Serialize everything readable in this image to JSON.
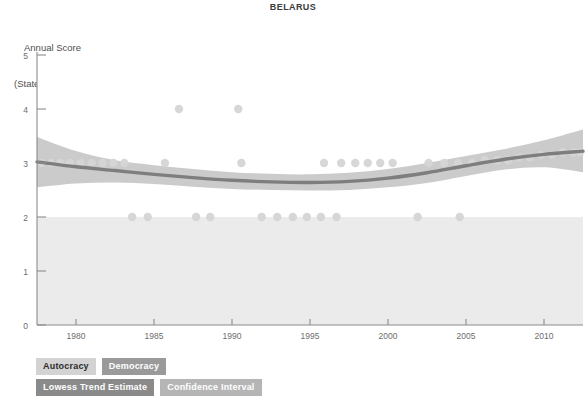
{
  "chart_data": {
    "type": "scatter",
    "title": "BELARUS",
    "ylabel_line1": "Annual Score",
    "ylabel_line2": "(State Department)",
    "xlabel": "",
    "xlim": [
      1977.5,
      2012.5
    ],
    "ylim": [
      0,
      5
    ],
    "yticks": [
      0,
      1,
      2,
      3,
      4,
      5
    ],
    "xticks": [
      1980,
      1985,
      1990,
      1995,
      2000,
      2005,
      2010
    ],
    "grid": false,
    "legend_position": "bottom-left",
    "series": [
      {
        "name": "Annual Score points",
        "points": [
          {
            "x": 1977.8,
            "y": 3.0
          },
          {
            "x": 1978.4,
            "y": 3.0
          },
          {
            "x": 1979.0,
            "y": 3.0
          },
          {
            "x": 1979.6,
            "y": 3.0
          },
          {
            "x": 1980.3,
            "y": 3.0
          },
          {
            "x": 1981.0,
            "y": 3.0
          },
          {
            "x": 1981.7,
            "y": 3.0
          },
          {
            "x": 1982.4,
            "y": 3.0
          },
          {
            "x": 1983.1,
            "y": 3.0
          },
          {
            "x": 1983.6,
            "y": 2.0
          },
          {
            "x": 1984.6,
            "y": 2.0
          },
          {
            "x": 1985.7,
            "y": 3.0
          },
          {
            "x": 1986.6,
            "y": 4.0
          },
          {
            "x": 1987.7,
            "y": 2.0
          },
          {
            "x": 1988.6,
            "y": 2.0
          },
          {
            "x": 1990.4,
            "y": 4.0
          },
          {
            "x": 1990.6,
            "y": 3.0
          },
          {
            "x": 1991.9,
            "y": 2.0
          },
          {
            "x": 1992.9,
            "y": 2.0
          },
          {
            "x": 1993.9,
            "y": 2.0
          },
          {
            "x": 1994.8,
            "y": 2.0
          },
          {
            "x": 1995.7,
            "y": 2.0
          },
          {
            "x": 1996.7,
            "y": 2.0
          },
          {
            "x": 1995.9,
            "y": 3.0
          },
          {
            "x": 1997.0,
            "y": 3.0
          },
          {
            "x": 1997.9,
            "y": 3.0
          },
          {
            "x": 1998.7,
            "y": 3.0
          },
          {
            "x": 1999.5,
            "y": 3.0
          },
          {
            "x": 2000.3,
            "y": 3.0
          },
          {
            "x": 2001.9,
            "y": 2.0
          },
          {
            "x": 2002.6,
            "y": 3.0
          },
          {
            "x": 2003.6,
            "y": 3.0
          },
          {
            "x": 2004.6,
            "y": 2.0
          },
          {
            "x": 2004.5,
            "y": 3.0
          },
          {
            "x": 2005.4,
            "y": 3.0
          },
          {
            "x": 2006.2,
            "y": 3.05
          },
          {
            "x": 2007.0,
            "y": 3.05
          },
          {
            "x": 2007.7,
            "y": 3.05
          },
          {
            "x": 2008.4,
            "y": 3.1
          },
          {
            "x": 2009.1,
            "y": 3.1
          },
          {
            "x": 2009.8,
            "y": 3.15
          },
          {
            "x": 2010.5,
            "y": 3.15
          },
          {
            "x": 2011.2,
            "y": 3.2
          },
          {
            "x": 2011.9,
            "y": 3.2
          },
          {
            "x": 2012.3,
            "y": 3.2
          }
        ]
      }
    ],
    "lowess_trend": {
      "name": "Lowess Trend Estimate",
      "x": [
        1977.5,
        1980,
        1982.5,
        1985,
        1987.5,
        1990,
        1992.5,
        1995,
        1997.5,
        2000,
        2002.5,
        2005,
        2007.5,
        2010,
        2012.5
      ],
      "y": [
        3.02,
        2.93,
        2.86,
        2.79,
        2.73,
        2.68,
        2.65,
        2.64,
        2.66,
        2.72,
        2.82,
        2.95,
        3.07,
        3.16,
        3.22
      ]
    },
    "confidence_interval": {
      "name": "Confidence Interval",
      "x": [
        1977.5,
        1980,
        1982.5,
        1985,
        1987.5,
        1990,
        1992.5,
        1995,
        1997.5,
        2000,
        2002.5,
        2005,
        2007.5,
        2010,
        2012.5
      ],
      "upper": [
        3.48,
        3.22,
        3.05,
        2.96,
        2.89,
        2.83,
        2.8,
        2.79,
        2.82,
        2.89,
        3.0,
        3.13,
        3.26,
        3.42,
        3.62
      ],
      "lower": [
        2.55,
        2.62,
        2.64,
        2.61,
        2.56,
        2.52,
        2.5,
        2.49,
        2.5,
        2.55,
        2.63,
        2.76,
        2.88,
        2.92,
        2.83
      ]
    },
    "regions": [
      {
        "name": "Autocracy",
        "y_from": 0,
        "y_to": 2.0,
        "color": "#ebebeb"
      },
      {
        "name": "Democracy",
        "y_from": 2.0,
        "y_to": 5.0,
        "color": "#ffffff"
      }
    ]
  },
  "legend": {
    "autocracy": "Autocracy",
    "democracy": "Democracy",
    "lowess": "Lowess Trend Estimate",
    "confidence": "Confidence Interval"
  },
  "colors": {
    "point": "#d5d5d5",
    "point_dark": "#b9b9b9",
    "trend": "#7e7e7e",
    "band": "#c2c2c2",
    "autocracy_region": "#ebebeb",
    "axis": "#8c8c8c",
    "text": "#6d6d6d"
  }
}
